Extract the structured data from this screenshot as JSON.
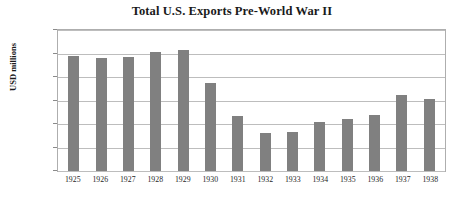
{
  "chart_data": {
    "type": "bar",
    "title": "Total U.S. Exports Pre-World War II",
    "xlabel": "",
    "ylabel": "USD millions",
    "categories": [
      "1925",
      "1926",
      "1927",
      "1928",
      "1929",
      "1930",
      "1931",
      "1932",
      "1933",
      "1934",
      "1935",
      "1936",
      "1937",
      "1938"
    ],
    "values": [
      4900,
      4800,
      4850,
      5050,
      5150,
      3750,
      2350,
      1600,
      1650,
      2100,
      2200,
      2400,
      3250,
      3050
    ],
    "ylim": [
      0,
      6000
    ],
    "ytick_values": [
      0,
      1000,
      2000,
      3000,
      4000,
      5000,
      6000
    ],
    "ytick_labels": [
      "$0",
      "$1,000",
      "$2,000",
      "$3,000",
      "$4,000",
      "$5,000",
      "$6,000"
    ],
    "grid": true,
    "legend": false,
    "bar_color": "#808080",
    "gridline_color": "#bdbdbd",
    "plot_border_color": "#aeaeae",
    "background_color": "#ffffff"
  }
}
